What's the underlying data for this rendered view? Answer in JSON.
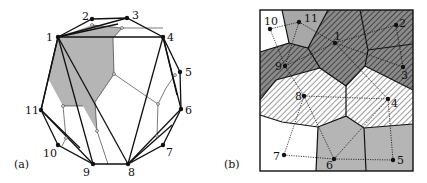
{
  "panel_a": {
    "caption": "(a)",
    "vertices": [
      {
        "id": "1",
        "x": 58,
        "y": 37,
        "lx": 46,
        "ly": 41
      },
      {
        "id": "2",
        "x": 92,
        "y": 19,
        "lx": 82,
        "ly": 20
      },
      {
        "id": "3",
        "x": 127,
        "y": 18,
        "lx": 132,
        "ly": 19
      },
      {
        "id": "4",
        "x": 163,
        "y": 37,
        "lx": 167,
        "ly": 41
      },
      {
        "id": "5",
        "x": 180,
        "y": 72,
        "lx": 185,
        "ly": 76
      },
      {
        "id": "6",
        "x": 181,
        "y": 109,
        "lx": 185,
        "ly": 114
      },
      {
        "id": "7",
        "x": 163,
        "y": 145,
        "lx": 166,
        "ly": 156
      },
      {
        "id": "8",
        "x": 128,
        "y": 164,
        "lx": 128,
        "ly": 176
      },
      {
        "id": "9",
        "x": 93,
        "y": 164,
        "lx": 83,
        "ly": 176
      },
      {
        "id": "10",
        "x": 58,
        "y": 145,
        "lx": 43,
        "ly": 157
      },
      {
        "id": "11",
        "x": 41,
        "y": 110,
        "lx": 25,
        "ly": 114
      }
    ]
  },
  "panel_b": {
    "caption": "(b)",
    "points": [
      {
        "id": "10",
        "x": 270,
        "y": 29,
        "lx": 264,
        "ly": 25
      },
      {
        "id": "11",
        "x": 299,
        "y": 22,
        "lx": 304,
        "ly": 22
      },
      {
        "id": "1",
        "x": 335,
        "y": 43,
        "lx": 334,
        "ly": 40
      },
      {
        "id": "2",
        "x": 396,
        "y": 25,
        "lx": 399,
        "ly": 27
      },
      {
        "id": "3",
        "x": 403,
        "y": 67,
        "lx": 401,
        "ly": 79
      },
      {
        "id": "9",
        "x": 285,
        "y": 66,
        "lx": 275,
        "ly": 70
      },
      {
        "id": "8",
        "x": 304,
        "y": 96,
        "lx": 295,
        "ly": 100
      },
      {
        "id": "4",
        "x": 388,
        "y": 99,
        "lx": 391,
        "ly": 107
      },
      {
        "id": "7",
        "x": 284,
        "y": 155,
        "lx": 273,
        "ly": 160
      },
      {
        "id": "6",
        "x": 334,
        "y": 159,
        "lx": 326,
        "ly": 169
      },
      {
        "id": "5",
        "x": 393,
        "y": 160,
        "lx": 397,
        "ly": 164
      }
    ]
  }
}
